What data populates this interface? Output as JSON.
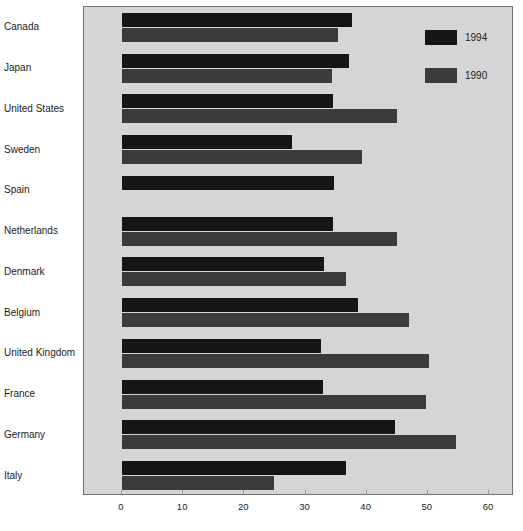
{
  "chart_data": {
    "type": "bar",
    "orientation": "horizontal",
    "title": "",
    "xlabel": "",
    "ylabel": "",
    "xlim": [
      0,
      60
    ],
    "xticks": [
      0,
      10,
      20,
      30,
      40,
      50,
      60
    ],
    "xtick_labels": [
      "0",
      "10",
      "20",
      "30",
      "40",
      "50",
      "60"
    ],
    "grid": false,
    "legend_position": "top-right",
    "categories": [
      "Canada",
      "Japan",
      "United States",
      "Sweden",
      "Spain",
      "Netherlands",
      "Denmark",
      "Belgium",
      "United Kingdom",
      "France",
      "Germany",
      "Italy"
    ],
    "series": [
      {
        "name": "1994",
        "color": "#161616",
        "values": [
          37.6,
          37.1,
          34.5,
          27.8,
          34.6,
          34.5,
          33.0,
          38.6,
          32.5,
          32.8,
          44.6,
          36.7
        ]
      },
      {
        "name": "1990",
        "color": "#3b3b3b",
        "values": [
          35.3,
          34.3,
          45.0,
          39.2,
          null,
          45.0,
          36.6,
          47.0,
          50.2,
          49.7,
          54.6,
          24.9
        ]
      }
    ]
  },
  "legend": {
    "entries": [
      {
        "label": "1994",
        "color": "#161616"
      },
      {
        "label": "1990",
        "color": "#3b3b3b"
      }
    ]
  },
  "colors": {
    "plot_background": "#d5d5d5",
    "page_background": "#ffffff",
    "frame_border": "#6f6f6f",
    "series_1994": "#161616",
    "series_1990": "#3b3b3b",
    "text": "#1b1b1b"
  }
}
